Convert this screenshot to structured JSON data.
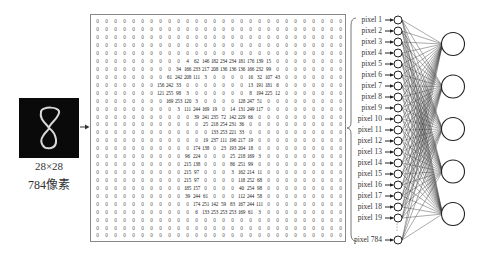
{
  "image": {
    "caption_dims": "28×28",
    "caption_pixels": "784像素",
    "digit": "8"
  },
  "matrix": {
    "rows": 28,
    "cols": 28,
    "values": [
      [
        0,
        0,
        0,
        0,
        0,
        0,
        0,
        0,
        0,
        0,
        0,
        0,
        0,
        0,
        0,
        0,
        0,
        0,
        0,
        0,
        0,
        0,
        0,
        0,
        0,
        0,
        0,
        0
      ],
      [
        0,
        0,
        0,
        0,
        0,
        0,
        0,
        0,
        0,
        0,
        0,
        0,
        0,
        0,
        0,
        0,
        0,
        0,
        0,
        0,
        0,
        0,
        0,
        0,
        0,
        0,
        0,
        0
      ],
      [
        0,
        0,
        0,
        0,
        0,
        0,
        0,
        0,
        0,
        0,
        0,
        0,
        0,
        0,
        0,
        0,
        0,
        0,
        0,
        0,
        0,
        0,
        0,
        0,
        0,
        0,
        0,
        0
      ],
      [
        0,
        0,
        0,
        0,
        0,
        0,
        0,
        0,
        0,
        0,
        0,
        0,
        0,
        0,
        0,
        0,
        0,
        0,
        0,
        0,
        0,
        0,
        0,
        0,
        0,
        0,
        0,
        0
      ],
      [
        0,
        0,
        0,
        0,
        0,
        0,
        0,
        0,
        0,
        0,
        0,
        0,
        0,
        0,
        0,
        0,
        0,
        0,
        0,
        0,
        0,
        0,
        0,
        0,
        0,
        0,
        0,
        0
      ],
      [
        0,
        0,
        0,
        0,
        0,
        0,
        0,
        0,
        0,
        0,
        4,
        62,
        146,
        182,
        234,
        234,
        181,
        176,
        139,
        15,
        0,
        0,
        0,
        0,
        0,
        0,
        0,
        0
      ],
      [
        0,
        0,
        0,
        0,
        0,
        0,
        0,
        0,
        0,
        34,
        166,
        233,
        217,
        208,
        136,
        136,
        136,
        166,
        232,
        99,
        0,
        0,
        0,
        0,
        0,
        0,
        0,
        0
      ],
      [
        0,
        0,
        0,
        0,
        0,
        0,
        0,
        0,
        61,
        242,
        208,
        111,
        3,
        0,
        0,
        0,
        0,
        16,
        32,
        107,
        43,
        0,
        0,
        0,
        0,
        0,
        0,
        0
      ],
      [
        0,
        0,
        0,
        0,
        0,
        0,
        0,
        156,
        242,
        33,
        0,
        0,
        0,
        0,
        0,
        0,
        0,
        13,
        191,
        181,
        6,
        0,
        0,
        0,
        0,
        0,
        0,
        0
      ],
      [
        0,
        0,
        0,
        0,
        0,
        0,
        0,
        121,
        255,
        98,
        3,
        0,
        0,
        0,
        0,
        0,
        0,
        8,
        194,
        225,
        12,
        0,
        0,
        0,
        0,
        0,
        0,
        0
      ],
      [
        0,
        0,
        0,
        0,
        0,
        0,
        0,
        0,
        169,
        253,
        120,
        3,
        0,
        0,
        0,
        0,
        128,
        247,
        51,
        0,
        0,
        0,
        0,
        0,
        0,
        0,
        0,
        0
      ],
      [
        0,
        0,
        0,
        0,
        0,
        0,
        0,
        0,
        0,
        3,
        111,
        244,
        169,
        19,
        0,
        14,
        131,
        249,
        117,
        0,
        0,
        0,
        0,
        0,
        0,
        0,
        0,
        0
      ],
      [
        0,
        0,
        0,
        0,
        0,
        0,
        0,
        0,
        0,
        0,
        0,
        39,
        241,
        235,
        72,
        142,
        229,
        66,
        0,
        0,
        0,
        0,
        0,
        0,
        0,
        0,
        0,
        0
      ],
      [
        0,
        0,
        0,
        0,
        0,
        0,
        0,
        0,
        0,
        0,
        0,
        0,
        25,
        218,
        254,
        231,
        36,
        0,
        0,
        0,
        0,
        0,
        0,
        0,
        0,
        0,
        0,
        0
      ],
      [
        0,
        0,
        0,
        0,
        0,
        0,
        0,
        0,
        0,
        0,
        0,
        0,
        0,
        133,
        253,
        221,
        33,
        0,
        0,
        0,
        0,
        0,
        0,
        0,
        0,
        0,
        0,
        0
      ],
      [
        0,
        0,
        0,
        0,
        0,
        0,
        0,
        0,
        0,
        0,
        0,
        0,
        19,
        237,
        111,
        196,
        217,
        19,
        0,
        0,
        0,
        0,
        0,
        0,
        0,
        0,
        0,
        0
      ],
      [
        0,
        0,
        0,
        0,
        0,
        0,
        0,
        0,
        0,
        0,
        0,
        174,
        138,
        0,
        23,
        193,
        204,
        18,
        0,
        0,
        0,
        0,
        0,
        0,
        0,
        0,
        0,
        0
      ],
      [
        0,
        0,
        0,
        0,
        0,
        0,
        0,
        0,
        0,
        0,
        96,
        224,
        0,
        0,
        0,
        25,
        218,
        169,
        3,
        0,
        0,
        0,
        0,
        0,
        0,
        0,
        0,
        0
      ],
      [
        0,
        0,
        0,
        0,
        0,
        0,
        0,
        0,
        0,
        0,
        215,
        138,
        0,
        0,
        0,
        86,
        251,
        99,
        0,
        0,
        0,
        0,
        0,
        0,
        0,
        0,
        0,
        0
      ],
      [
        0,
        0,
        0,
        0,
        0,
        0,
        0,
        0,
        0,
        0,
        215,
        97,
        0,
        0,
        0,
        3,
        162,
        214,
        11,
        0,
        0,
        0,
        0,
        0,
        0,
        0,
        0,
        0
      ],
      [
        0,
        0,
        0,
        0,
        0,
        0,
        0,
        0,
        0,
        0,
        215,
        97,
        0,
        0,
        0,
        0,
        118,
        252,
        68,
        0,
        0,
        0,
        0,
        0,
        0,
        0,
        0,
        0
      ],
      [
        0,
        0,
        0,
        0,
        0,
        0,
        0,
        0,
        0,
        0,
        185,
        157,
        0,
        0,
        0,
        0,
        40,
        254,
        98,
        0,
        0,
        0,
        0,
        0,
        0,
        0,
        0,
        0
      ],
      [
        0,
        0,
        0,
        0,
        0,
        0,
        0,
        0,
        0,
        0,
        39,
        244,
        61,
        0,
        0,
        0,
        112,
        244,
        58,
        0,
        0,
        0,
        0,
        0,
        0,
        0,
        0,
        0
      ],
      [
        0,
        0,
        0,
        0,
        0,
        0,
        0,
        0,
        0,
        0,
        0,
        174,
        251,
        142,
        59,
        83,
        167,
        244,
        111,
        0,
        0,
        0,
        0,
        0,
        0,
        0,
        0,
        0
      ],
      [
        0,
        0,
        0,
        0,
        0,
        0,
        0,
        0,
        0,
        0,
        0,
        6,
        133,
        253,
        253,
        253,
        169,
        61,
        3,
        0,
        0,
        0,
        0,
        0,
        0,
        0,
        0,
        0
      ],
      [
        0,
        0,
        0,
        0,
        0,
        0,
        0,
        0,
        0,
        0,
        0,
        0,
        0,
        0,
        0,
        0,
        0,
        0,
        0,
        0,
        0,
        0,
        0,
        0,
        0,
        0,
        0,
        0
      ],
      [
        0,
        0,
        0,
        0,
        0,
        0,
        0,
        0,
        0,
        0,
        0,
        0,
        0,
        0,
        0,
        0,
        0,
        0,
        0,
        0,
        0,
        0,
        0,
        0,
        0,
        0,
        0,
        0
      ],
      [
        0,
        0,
        0,
        0,
        0,
        0,
        0,
        0,
        0,
        0,
        0,
        0,
        0,
        0,
        0,
        0,
        0,
        0,
        0,
        0,
        0,
        0,
        0,
        0,
        0,
        0,
        0,
        0
      ]
    ]
  },
  "input_layer": {
    "labels": [
      "pixel 1",
      "pixel 2",
      "pixel 3",
      "pixel 4",
      "pixel 5",
      "pixel 6",
      "pixel 7",
      "pixel 8",
      "pixel 9",
      "pixel 10",
      "pixel 11",
      "pixel 12",
      "pixel 13",
      "pixel 14",
      "pixel 15",
      "pixel 16",
      "pixel 17",
      "pixel 18",
      "pixel 19"
    ],
    "last_label": "pixel 784",
    "ellipsis": "⋮"
  },
  "output_layer": {
    "node_count": 5
  },
  "colors": {
    "line": "#333333",
    "image_bg": "#0a0a0a",
    "stroke": "#cccccc"
  }
}
